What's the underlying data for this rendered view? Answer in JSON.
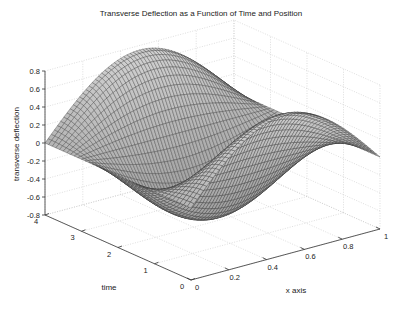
{
  "chart_data": {
    "type": "surface",
    "title": "Transverse Deflection as a Function of Time and Position",
    "xlabel": "x axis",
    "ylabel": "time",
    "zlabel": "transverse deflection",
    "xlim": [
      0,
      1
    ],
    "ylim": [
      0,
      4
    ],
    "zlim": [
      -0.8,
      0.8
    ],
    "x_ticks": [
      "0",
      "0.2",
      "0.4",
      "0.6",
      "0.8",
      "1"
    ],
    "y_ticks": [
      "0",
      "1",
      "2",
      "3",
      "4"
    ],
    "z_ticks": [
      "-0.8",
      "-0.6",
      "-0.4",
      "-0.2",
      "0",
      "0.2",
      "0.4",
      "0.6",
      "0.8"
    ],
    "grid": true,
    "colormap": "gray",
    "surface_model": "z = 0.75*sin(pi*x)*cos(pi*t/2)",
    "x": [
      0,
      0.1,
      0.2,
      0.3,
      0.4,
      0.5,
      0.6,
      0.7,
      0.8,
      0.9,
      1.0
    ],
    "t": [
      0,
      0.5,
      1.0,
      1.5,
      2.0,
      2.5,
      3.0,
      3.5,
      4.0
    ],
    "z": [
      [
        0,
        0.232,
        0.441,
        0.607,
        0.713,
        0.75,
        0.713,
        0.607,
        0.441,
        0.232,
        0
      ],
      [
        0,
        0.164,
        0.312,
        0.429,
        0.504,
        0.53,
        0.504,
        0.429,
        0.312,
        0.164,
        0
      ],
      [
        0,
        0,
        0,
        0,
        0,
        0,
        0,
        0,
        0,
        0,
        0
      ],
      [
        0,
        -0.164,
        -0.312,
        -0.429,
        -0.504,
        -0.53,
        -0.504,
        -0.429,
        -0.312,
        -0.164,
        0
      ],
      [
        0,
        -0.232,
        -0.441,
        -0.607,
        -0.713,
        -0.75,
        -0.713,
        -0.607,
        -0.441,
        -0.232,
        0
      ],
      [
        0,
        -0.164,
        -0.312,
        -0.429,
        -0.504,
        -0.53,
        -0.504,
        -0.429,
        -0.312,
        -0.164,
        0
      ],
      [
        0,
        0,
        0,
        0,
        0,
        0,
        0,
        0,
        0,
        0,
        0
      ],
      [
        0,
        0.164,
        0.312,
        0.429,
        0.504,
        0.53,
        0.504,
        0.429,
        0.312,
        0.164,
        0
      ],
      [
        0,
        0.232,
        0.441,
        0.607,
        0.713,
        0.75,
        0.713,
        0.607,
        0.441,
        0.232,
        0
      ]
    ]
  }
}
